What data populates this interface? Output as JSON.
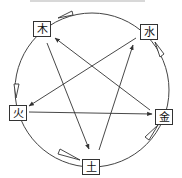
{
  "diagram": {
    "type": "five-elements-cycle",
    "colors": {
      "line": "#333333",
      "box_border": "#333333",
      "text": "#111111",
      "background": "#ffffff"
    },
    "elements": [
      {
        "id": "wood",
        "label": "木",
        "x": 41,
        "y": 28
      },
      {
        "id": "water",
        "label": "水",
        "x": 148,
        "y": 31
      },
      {
        "id": "fire",
        "label": "火",
        "x": 17,
        "y": 112
      },
      {
        "id": "metal",
        "label": "金",
        "x": 163,
        "y": 116
      },
      {
        "id": "earth",
        "label": "土",
        "x": 90,
        "y": 166
      }
    ],
    "outer_cycle": {
      "description": "generating cycle (clockwise, hollow arrowheads)",
      "edges": [
        {
          "from": "木",
          "to": "火"
        },
        {
          "from": "火",
          "to": "土"
        },
        {
          "from": "土",
          "to": "金"
        },
        {
          "from": "金",
          "to": "水"
        },
        {
          "from": "水",
          "to": "木"
        }
      ]
    },
    "inner_star": {
      "description": "overcoming cycle (straight lines, filled arrowheads)",
      "edges": [
        {
          "from": "木",
          "to": "土"
        },
        {
          "from": "土",
          "to": "水"
        },
        {
          "from": "水",
          "to": "火"
        },
        {
          "from": "火",
          "to": "金"
        },
        {
          "from": "金",
          "to": "木"
        }
      ]
    }
  }
}
